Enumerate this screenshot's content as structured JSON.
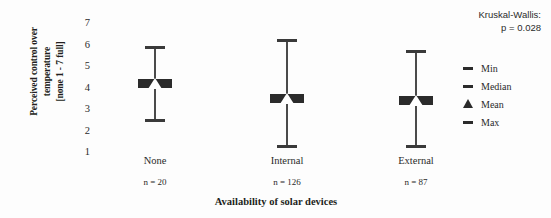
{
  "chart_data": {
    "type": "box",
    "title": "",
    "subtitle": "",
    "xlabel": "Availability of solar devices",
    "ylabel": "Perceived control over temperature [none 1 - 7 full]",
    "ylabel_lines": [
      "Perceived control over",
      "temperature",
      "[none 1 - 7 full]"
    ],
    "ylim": [
      1,
      7
    ],
    "yticks": [
      7,
      6,
      5,
      4,
      3,
      2,
      1
    ],
    "grid": false,
    "categories": [
      "None",
      "Internal",
      "External"
    ],
    "sample_sizes": [
      "n = 20",
      "n = 126",
      "n = 87"
    ],
    "annotation": {
      "line1": "Kruskal-Wallis:",
      "line2": "p = 0.028"
    },
    "series": [
      {
        "name": "Min",
        "marker": "dash",
        "values": [
          2.5,
          1.3,
          1.3
        ]
      },
      {
        "name": "Median",
        "marker": "dash",
        "values": [
          4.2,
          3.5,
          3.4
        ]
      },
      {
        "name": "Mean",
        "marker": "triangle",
        "values": [
          4.2,
          3.5,
          3.4
        ]
      },
      {
        "name": "Max",
        "marker": "dash",
        "values": [
          5.9,
          6.2,
          5.7
        ]
      }
    ],
    "legend": {
      "position": "right",
      "entries": [
        {
          "label": "Min",
          "marker": "dash"
        },
        {
          "label": "Median",
          "marker": "dash"
        },
        {
          "label": "Mean",
          "marker": "triangle"
        },
        {
          "label": "Max",
          "marker": "dash"
        }
      ]
    },
    "colors": {
      "stem": "#4a4a4a",
      "cap": "#3a3a3a",
      "median": "#2b2b2b",
      "mean_fill": "#ffffff",
      "text": "#2b2b2b",
      "background": "#fdfdfd"
    }
  }
}
